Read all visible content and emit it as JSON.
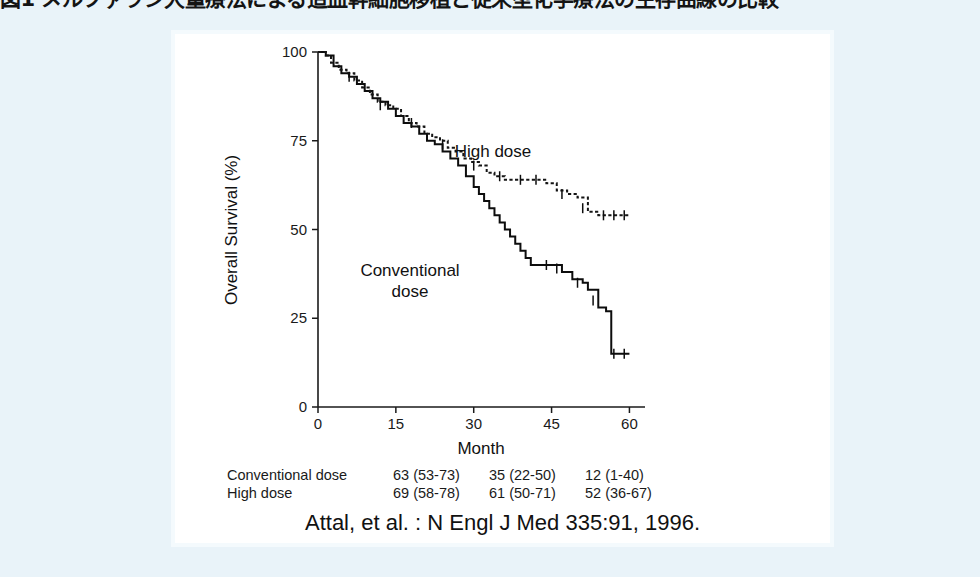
{
  "slide": {
    "title": "図1 メルファラン大量療法による造血幹細胞移植と従来型化学療法の生存曲線の比較"
  },
  "figure": {
    "citation": "Attal, et al. : N Engl J Med 335:91, 1996.",
    "annotations": {
      "high_dose": "High dose",
      "conventional_dose_line1": "Conventional",
      "conventional_dose_line2": "dose"
    },
    "risk_table": {
      "rows": [
        {
          "label": "Conventional dose",
          "cells": [
            "63 (53-73)",
            "35 (22-50)",
            "12 (1-40)"
          ]
        },
        {
          "label": "High dose",
          "cells": [
            "69 (58-78)",
            "61 (50-71)",
            "52 (36-67)"
          ]
        }
      ]
    }
  },
  "chart_data": {
    "type": "line",
    "title": "",
    "xlabel": "Month",
    "ylabel": "Overall Survival (%)",
    "xlim": [
      0,
      63
    ],
    "ylim": [
      0,
      100
    ],
    "xticks": [
      0,
      15,
      30,
      45,
      60
    ],
    "yticks": [
      0,
      25,
      50,
      75,
      100
    ],
    "xtick_labels": [
      "0",
      "15",
      "30",
      "45",
      "60"
    ],
    "ytick_labels": [
      "0",
      "25",
      "50",
      "75",
      "100"
    ],
    "grid": false,
    "legend_position": "inline-annotation",
    "series": [
      {
        "name": "High dose",
        "style": "dashed",
        "points": [
          [
            0,
            100
          ],
          [
            1.5,
            99
          ],
          [
            2.5,
            97
          ],
          [
            4,
            95
          ],
          [
            5.5,
            94
          ],
          [
            7,
            92
          ],
          [
            8.5,
            90
          ],
          [
            10,
            88
          ],
          [
            11.5,
            86
          ],
          [
            13,
            85
          ],
          [
            14.5,
            84
          ],
          [
            16,
            82
          ],
          [
            17.5,
            80
          ],
          [
            19,
            79
          ],
          [
            20.5,
            77
          ],
          [
            22,
            76
          ],
          [
            23.5,
            75
          ],
          [
            25,
            73
          ],
          [
            26.5,
            72
          ],
          [
            28,
            70
          ],
          [
            29.5,
            69
          ],
          [
            31,
            68
          ],
          [
            32.5,
            66
          ],
          [
            34,
            65
          ],
          [
            36,
            64
          ],
          [
            38,
            64
          ],
          [
            41,
            64
          ],
          [
            44,
            63
          ],
          [
            46,
            61
          ],
          [
            48,
            60
          ],
          [
            50,
            59
          ],
          [
            52,
            55
          ],
          [
            54,
            54
          ],
          [
            56,
            54
          ],
          [
            58,
            54
          ],
          [
            60,
            54
          ]
        ],
        "censored": [
          [
            6,
            93
          ],
          [
            12,
            85
          ],
          [
            18,
            80
          ],
          [
            24,
            74
          ],
          [
            30,
            68
          ],
          [
            35,
            65
          ],
          [
            39,
            64
          ],
          [
            42,
            64
          ],
          [
            47,
            60
          ],
          [
            51,
            56
          ],
          [
            55,
            54
          ],
          [
            57,
            54
          ],
          [
            59,
            54
          ]
        ],
        "milestones": [
          {
            "month": 20,
            "value": 69,
            "ci": [
              58,
              78
            ]
          },
          {
            "month": 40,
            "value": 61,
            "ci": [
              50,
              71
            ]
          },
          {
            "month": 60,
            "value": 52,
            "ci": [
              36,
              67
            ]
          }
        ]
      },
      {
        "name": "Conventional dose",
        "style": "solid",
        "points": [
          [
            0,
            100
          ],
          [
            1.5,
            99
          ],
          [
            3,
            96
          ],
          [
            4.5,
            94
          ],
          [
            6,
            93
          ],
          [
            7.5,
            91
          ],
          [
            9,
            89
          ],
          [
            10.5,
            87
          ],
          [
            12,
            86
          ],
          [
            13.5,
            84
          ],
          [
            15,
            82
          ],
          [
            16.5,
            80
          ],
          [
            18,
            79
          ],
          [
            19.5,
            77
          ],
          [
            21,
            75
          ],
          [
            22.5,
            74
          ],
          [
            24,
            72
          ],
          [
            25.5,
            70
          ],
          [
            27,
            68
          ],
          [
            28.5,
            65
          ],
          [
            30,
            62
          ],
          [
            31,
            60
          ],
          [
            32,
            58
          ],
          [
            33,
            56
          ],
          [
            34,
            54
          ],
          [
            35,
            52
          ],
          [
            36,
            50
          ],
          [
            37,
            48
          ],
          [
            38,
            46
          ],
          [
            39,
            44
          ],
          [
            40,
            42
          ],
          [
            41,
            40
          ],
          [
            43,
            40
          ],
          [
            45,
            40
          ],
          [
            47,
            38
          ],
          [
            49,
            36
          ],
          [
            51,
            35
          ],
          [
            52,
            33
          ],
          [
            54,
            28
          ],
          [
            55.5,
            27
          ],
          [
            56.5,
            15
          ],
          [
            58.5,
            15
          ],
          [
            60,
            15
          ]
        ],
        "censored": [
          [
            44,
            40
          ],
          [
            46,
            39
          ],
          [
            50,
            35
          ],
          [
            53,
            30
          ],
          [
            57,
            15
          ],
          [
            59,
            15
          ]
        ],
        "milestones": [
          {
            "month": 20,
            "value": 63,
            "ci": [
              53,
              73
            ]
          },
          {
            "month": 40,
            "value": 35,
            "ci": [
              22,
              50
            ]
          },
          {
            "month": 60,
            "value": 12,
            "ci": [
              1,
              40
            ]
          }
        ]
      }
    ]
  }
}
